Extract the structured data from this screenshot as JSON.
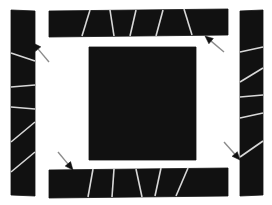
{
  "figure": {
    "canvas": {
      "width": 272,
      "height": 205
    },
    "colors": {
      "background": "#ffffff",
      "block_fill": "#111111",
      "block_edge": "#111111",
      "divider_line": "#d8d8d8",
      "arrow": "#8c8c8c"
    },
    "style": {
      "divider_line_width": 1.6,
      "arrow_line_width": 1.4,
      "arrow_head_length": 8,
      "arrow_head_width": 7
    },
    "blocks": [
      {
        "id": "center-square",
        "name": "center-square",
        "label": "Center square",
        "polygon": [
          [
            89,
            47
          ],
          [
            196,
            47
          ],
          [
            196,
            160
          ],
          [
            89,
            160
          ]
        ],
        "dividers": []
      },
      {
        "id": "top-bar",
        "name": "top-bar",
        "label": "Top bar",
        "polygon": [
          [
            49,
            11
          ],
          [
            228,
            9
          ],
          [
            228,
            35
          ],
          [
            49,
            37
          ]
        ],
        "dividers": [
          [
            [
              90,
              10
            ],
            [
              82,
              36
            ]
          ],
          [
            [
              110,
              10
            ],
            [
              114,
              36
            ]
          ],
          [
            [
              136,
              10
            ],
            [
              130,
              36
            ]
          ],
          [
            [
              163,
              10
            ],
            [
              156,
              36
            ]
          ],
          [
            [
              184,
              9
            ],
            [
              192,
              35
            ]
          ]
        ]
      },
      {
        "id": "bottom-bar",
        "name": "bottom-bar",
        "label": "Bottom bar",
        "polygon": [
          [
            49,
            170
          ],
          [
            228,
            168
          ],
          [
            228,
            196
          ],
          [
            49,
            198
          ]
        ],
        "dividers": [
          [
            [
              93,
              169
            ],
            [
              88,
              197
            ]
          ],
          [
            [
              114,
              169
            ],
            [
              112,
              197
            ]
          ],
          [
            [
              136,
              169
            ],
            [
              142,
              197
            ]
          ],
          [
            [
              161,
              168
            ],
            [
              155,
              196
            ]
          ],
          [
            [
              188,
              168
            ],
            [
              176,
              196
            ]
          ]
        ]
      },
      {
        "id": "left-bar",
        "name": "left-bar",
        "label": "Left bar",
        "polygon": [
          [
            11,
            10
          ],
          [
            35,
            11
          ],
          [
            35,
            196
          ],
          [
            11,
            195
          ]
        ],
        "dividers": [
          [
            [
              11,
              53
            ],
            [
              35,
              61
            ]
          ],
          [
            [
              11,
              87
            ],
            [
              35,
              85
            ]
          ],
          [
            [
              11,
              107
            ],
            [
              35,
              109
            ]
          ],
          [
            [
              11,
              142
            ],
            [
              35,
              122
            ]
          ],
          [
            [
              11,
              172
            ],
            [
              35,
              152
            ]
          ]
        ]
      },
      {
        "id": "right-bar",
        "name": "right-bar",
        "label": "Right bar",
        "polygon": [
          [
            240,
            11
          ],
          [
            263,
            10
          ],
          [
            263,
            195
          ],
          [
            240,
            196
          ]
        ],
        "dividers": [
          [
            [
              240,
              52
            ],
            [
              263,
              47
            ]
          ],
          [
            [
              240,
              82
            ],
            [
              263,
              68
            ]
          ],
          [
            [
              240,
              97
            ],
            [
              263,
              95
            ]
          ],
          [
            [
              240,
              118
            ],
            [
              263,
              113
            ]
          ],
          [
            [
              240,
              157
            ],
            [
              263,
              141
            ]
          ]
        ]
      }
    ],
    "arrows": [
      {
        "id": "arrow-top-left",
        "name": "arrow-top-left",
        "label": "Arrow pointing up-left at left bar",
        "from": [
          49,
          62
        ],
        "to": [
          33,
          43
        ],
        "direction": "up-left"
      },
      {
        "id": "arrow-top-right",
        "name": "arrow-top-right",
        "label": "Arrow pointing up-left at top bar",
        "from": [
          224,
          52
        ],
        "to": [
          205,
          36
        ],
        "direction": "up-left"
      },
      {
        "id": "arrow-bottom-left",
        "name": "arrow-bottom-left",
        "label": "Arrow pointing down-right at bottom bar",
        "from": [
          58,
          152
        ],
        "to": [
          73,
          170
        ],
        "direction": "down-right"
      },
      {
        "id": "arrow-bottom-right",
        "name": "arrow-bottom-right",
        "label": "Arrow pointing down-right at right bar",
        "from": [
          224,
          142
        ],
        "to": [
          240,
          160
        ],
        "direction": "down-right"
      }
    ]
  }
}
